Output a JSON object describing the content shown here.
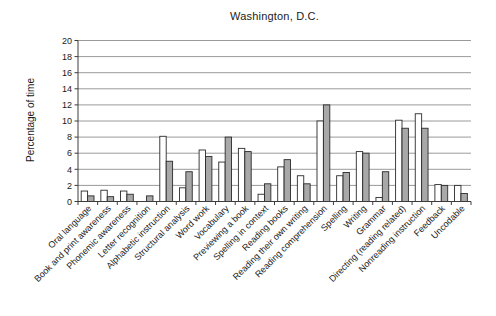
{
  "chart_data": {
    "type": "bar",
    "title": "Washington, D.C.",
    "ylabel": "Percentage of time",
    "xlabel": "",
    "ylim": [
      0,
      20
    ],
    "yticks": [
      0,
      2,
      4,
      6,
      8,
      10,
      12,
      14,
      16,
      18,
      20
    ],
    "grid": true,
    "legend_position": "none",
    "categories": [
      "Oral language",
      "Book and print awareness",
      "Phonemic awareness",
      "Letter recognition",
      "Alphabetic instruction",
      "Structural analysis",
      "Word work",
      "Vocabulary",
      "Previewing a book",
      "Spelling in context",
      "Reading books",
      "Reading their own writing",
      "Reading comprehension",
      "Spelling",
      "Writing",
      "Grammar",
      "Directing (reading related)",
      "Nonreading instruction",
      "Feedback",
      "Uncodable"
    ],
    "series": [
      {
        "name": "white bars",
        "color": "#ffffff",
        "values": [
          1.3,
          1.4,
          1.3,
          0,
          8.1,
          1.7,
          6.4,
          4.9,
          6.6,
          0.9,
          4.3,
          3.2,
          10.0,
          3.2,
          6.2,
          0.5,
          10.1,
          10.9,
          2.1,
          2.0
        ]
      },
      {
        "name": "gray bars",
        "color": "#a8a8a8",
        "values": [
          0.7,
          0.6,
          0.9,
          0.7,
          5.0,
          3.7,
          5.6,
          8.0,
          6.2,
          2.2,
          5.2,
          2.2,
          12.0,
          3.6,
          6.0,
          3.7,
          9.1,
          9.1,
          2.0,
          1.0
        ]
      }
    ],
    "colors": {
      "axis": "#3c3c3c",
      "gridline": "#9a9a9a",
      "text": "#1a1a1a",
      "bar_outline": "#2b2b2b",
      "background": "#ffffff"
    }
  }
}
